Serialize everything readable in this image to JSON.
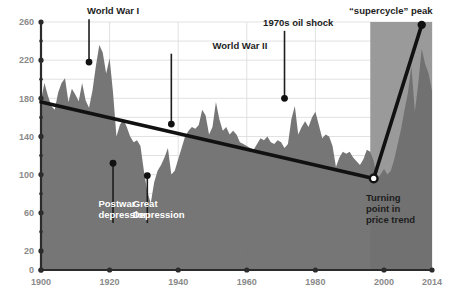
{
  "chart_data": {
    "type": "area",
    "title": "",
    "subtitle": "",
    "xlabel": "",
    "ylabel": "",
    "xlim": [
      1900,
      2014
    ],
    "ylim": [
      0,
      260
    ],
    "grid": true,
    "legend_position": "none",
    "x_ticks": [
      "1900",
      "1920",
      "1940",
      "1960",
      "1980",
      "2000",
      "2014"
    ],
    "x_tick_values": [
      1900,
      1920,
      1940,
      1960,
      1980,
      2000,
      2014
    ],
    "y_ticks": [
      "0",
      "20",
      "60",
      "100",
      "140",
      "180",
      "220",
      "260"
    ],
    "y_tick_values": [
      0,
      20,
      60,
      100,
      140,
      180,
      220,
      260
    ],
    "y_minor_values": [
      40,
      80,
      120,
      160,
      200,
      240
    ],
    "series": [
      {
        "name": "Real commodity price index",
        "type": "area",
        "fill_color": "#6f6f6f",
        "x": [
          1900,
          1901,
          1902,
          1903,
          1904,
          1905,
          1906,
          1907,
          1908,
          1909,
          1910,
          1911,
          1912,
          1913,
          1914,
          1915,
          1916,
          1917,
          1918,
          1919,
          1920,
          1921,
          1922,
          1923,
          1924,
          1925,
          1926,
          1927,
          1928,
          1929,
          1930,
          1931,
          1932,
          1933,
          1934,
          1935,
          1936,
          1937,
          1938,
          1939,
          1940,
          1941,
          1942,
          1943,
          1944,
          1945,
          1946,
          1947,
          1948,
          1949,
          1950,
          1951,
          1952,
          1953,
          1954,
          1955,
          1956,
          1957,
          1958,
          1959,
          1960,
          1961,
          1962,
          1963,
          1964,
          1965,
          1966,
          1967,
          1968,
          1969,
          1970,
          1971,
          1972,
          1973,
          1974,
          1975,
          1976,
          1977,
          1978,
          1979,
          1980,
          1981,
          1982,
          1983,
          1984,
          1985,
          1986,
          1987,
          1988,
          1989,
          1990,
          1991,
          1992,
          1993,
          1994,
          1995,
          1996,
          1997,
          1998,
          1999,
          2000,
          2001,
          2002,
          2003,
          2004,
          2005,
          2006,
          2007,
          2008,
          2009,
          2010,
          2011,
          2012,
          2013,
          2014
        ],
        "values": [
          178,
          196,
          183,
          172,
          168,
          186,
          196,
          201,
          176,
          190,
          184,
          177,
          196,
          178,
          170,
          188,
          214,
          236,
          228,
          206,
          222,
          186,
          140,
          152,
          158,
          150,
          140,
          134,
          136,
          130,
          104,
          82,
          70,
          92,
          104,
          110,
          118,
          128,
          100,
          104,
          116,
          128,
          140,
          146,
          150,
          148,
          152,
          168,
          162,
          142,
          150,
          176,
          158,
          146,
          150,
          142,
          146,
          142,
          134,
          132,
          130,
          128,
          126,
          132,
          138,
          136,
          140,
          134,
          132,
          136,
          134,
          128,
          132,
          158,
          172,
          142,
          150,
          156,
          150,
          160,
          166,
          152,
          138,
          142,
          140,
          130,
          108,
          118,
          124,
          122,
          124,
          118,
          114,
          110,
          116,
          126,
          124,
          114,
          96,
          100,
          106,
          100,
          104,
          116,
          132,
          148,
          168,
          186,
          214,
          166,
          196,
          232,
          216,
          206,
          188
        ]
      }
    ],
    "highlight_band": {
      "label": "supercycle era shading",
      "x_start": 1996,
      "x_end": 2014,
      "color": "#9a9a9a"
    },
    "trend_segments": [
      {
        "name": "long-run declining trend",
        "points": [
          [
            1900,
            176
          ],
          [
            1997,
            96
          ]
        ],
        "color": "#111111"
      },
      {
        "name": "supercycle rise",
        "points": [
          [
            1997,
            96
          ],
          [
            2011,
            257
          ]
        ],
        "color": "#111111"
      }
    ],
    "annotations": [
      {
        "id": "world-war-1",
        "text": "World War I",
        "label_x": 1921,
        "label_y": 268,
        "point_x": 1914,
        "point_y": 218,
        "style": "dark"
      },
      {
        "id": "world-war-2",
        "text": "World War II",
        "label_x": 1958,
        "label_y": 232,
        "point_x": 1938,
        "point_y": 153,
        "style": "dark"
      },
      {
        "id": "oil-shock",
        "text": "1970s oil shock",
        "label_x": 1975,
        "label_y": 256,
        "point_x": 1971,
        "point_y": 180,
        "style": "dark"
      },
      {
        "id": "supercycle",
        "text": "“supercycle” peak",
        "label_x": 2002,
        "label_y": 268,
        "point_x": 2011,
        "point_y": 257,
        "style": "dark"
      },
      {
        "id": "postwar",
        "text": "Postwar\ndepression",
        "label_x": 1922,
        "label_y": 66,
        "point_x": 1921,
        "point_y": 112,
        "style": "light"
      },
      {
        "id": "great-depression",
        "text": "Great\nDepression",
        "label_x": 1932,
        "label_y": 66,
        "point_x": 1931,
        "point_y": 99,
        "style": "light"
      },
      {
        "id": "turning-point",
        "text": "Turning\npoint in\nprice trend",
        "label_x": 2000,
        "label_y": 72,
        "point_x": 1997,
        "point_y": 96,
        "style": "dark-boxed"
      }
    ],
    "markers": [
      {
        "id": "turning-point-marker",
        "x": 1997,
        "y": 96,
        "style": "open-circle"
      },
      {
        "id": "supercycle-peak-marker",
        "x": 2011,
        "y": 257,
        "style": "filled-circle"
      }
    ]
  },
  "annotation_text": {
    "world_war_1": "World War I",
    "world_war_2": "World War II",
    "oil_shock": "1970s oil shock",
    "supercycle": "“supercycle” peak",
    "postwar_line1": "Postwar",
    "postwar_line2": "depression",
    "great_depression_line1": "Great",
    "great_depression_line2": "Depression",
    "turning_line1": "Turning",
    "turning_line2": "point in",
    "turning_line3": "price trend"
  },
  "axis": {
    "x_labels": [
      "1900",
      "1920",
      "1940",
      "1960",
      "1980",
      "2000",
      "2014"
    ],
    "y_labels": [
      "260",
      "220",
      "180",
      "140",
      "100",
      "60",
      "20",
      "0"
    ]
  },
  "colors": {
    "area_fill": "#6f6f6f",
    "highlight_fill": "#9a9a9a",
    "axis": "#2b2b2b",
    "grid": "#d9d9d9",
    "trend": "#111111",
    "tick_text": "#8a8a8a",
    "background": "#ffffff"
  }
}
